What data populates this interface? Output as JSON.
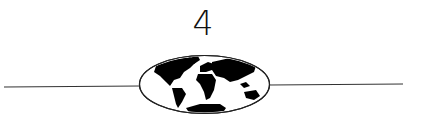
{
  "chapter": {
    "number": "4"
  },
  "ornament": {
    "icon": "world-map-globe-icon",
    "line_color": "#333333",
    "land_color": "#000000"
  }
}
